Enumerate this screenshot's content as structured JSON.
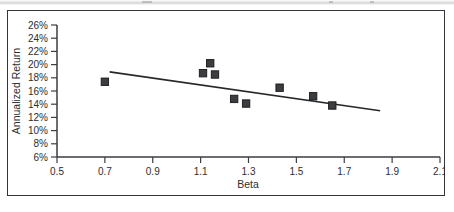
{
  "figure": {
    "frame_color": "#33363a",
    "background": "#ffffff",
    "marker_color": "#3b3d40",
    "line_color": "#26282b"
  },
  "axes": {
    "x_title": "Beta",
    "y_title": "Annualized Return",
    "x_ticks": [
      "0.5",
      "0.7",
      "0.9",
      "1.1",
      "1.3",
      "1.5",
      "1.7",
      "1.9",
      "2.1"
    ],
    "y_ticks": [
      "26%",
      "24%",
      "22%",
      "20%",
      "18%",
      "16%",
      "14%",
      "12%",
      "10%",
      "8%",
      "6%"
    ]
  },
  "chart_data": {
    "type": "scatter",
    "title": "",
    "xlabel": "Beta",
    "ylabel": "Annualized Return",
    "xlim": [
      0.5,
      2.1
    ],
    "ylim": [
      6,
      26
    ],
    "x_tick_values": [
      0.5,
      0.7,
      0.9,
      1.1,
      1.3,
      1.5,
      1.7,
      1.9,
      2.1
    ],
    "y_tick_values": [
      6,
      8,
      10,
      12,
      14,
      16,
      18,
      20,
      22,
      24,
      26
    ],
    "y_tick_unit": "%",
    "grid": false,
    "legend": false,
    "marker_shape": "square",
    "points": [
      {
        "x": 0.7,
        "y": 17.4
      },
      {
        "x": 1.11,
        "y": 18.7
      },
      {
        "x": 1.14,
        "y": 20.2
      },
      {
        "x": 1.16,
        "y": 18.5
      },
      {
        "x": 1.24,
        "y": 14.8
      },
      {
        "x": 1.29,
        "y": 14.1
      },
      {
        "x": 1.43,
        "y": 16.5
      },
      {
        "x": 1.57,
        "y": 15.2
      },
      {
        "x": 1.65,
        "y": 13.8
      }
    ],
    "series": [
      {
        "name": "Funds",
        "x": [
          0.7,
          1.11,
          1.14,
          1.16,
          1.24,
          1.29,
          1.43,
          1.57,
          1.65
        ],
        "values": [
          17.4,
          18.7,
          20.2,
          18.5,
          14.8,
          14.1,
          16.5,
          15.2,
          13.8
        ]
      }
    ],
    "trendline": {
      "type": "linear",
      "x_start": 0.72,
      "y_start": 18.9,
      "x_end": 1.85,
      "y_end": 13.0
    }
  }
}
